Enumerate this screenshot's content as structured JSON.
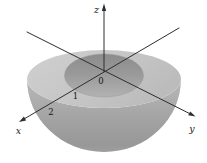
{
  "figure": {
    "kind": "3d-math-diagram",
    "axes": {
      "x_label": "x",
      "y_label": "y",
      "z_label": "z",
      "origin_label": "0"
    },
    "ticks": {
      "inner_radius_label": "1",
      "outer_radius_label": "2"
    },
    "colors": {
      "background": "#ffffff",
      "top_surface_light": "#cdcdcd",
      "top_surface_dark": "#bdbdbd",
      "side_surface": "#a5a5a5",
      "hole_interior": "#919191",
      "axis_line": "#2e2e2e"
    }
  }
}
